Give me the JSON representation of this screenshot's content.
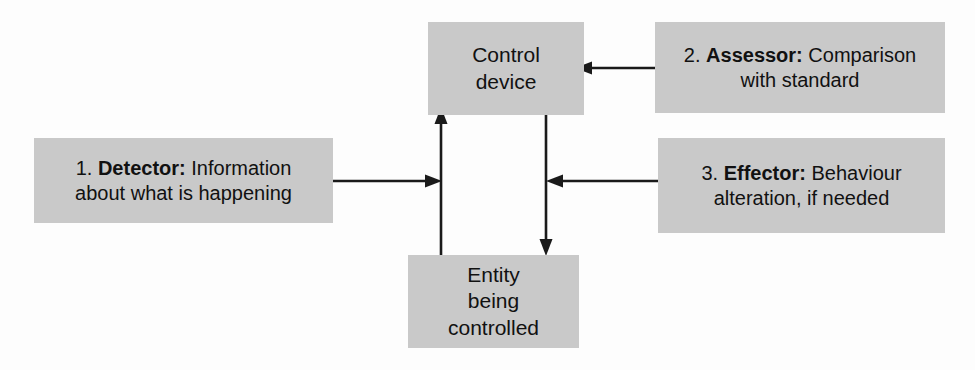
{
  "diagram": {
    "background_color": "#ffffff",
    "box_fill_color": "#c9c9c9",
    "text_color": "#111111",
    "arrow_color": "#1a1a1a",
    "nodes": {
      "control_device": {
        "label": "Control device",
        "line1": "Control",
        "line2": "device"
      },
      "entity_controlled": {
        "label": "Entity being controlled",
        "line1": "Entity",
        "line2": "being",
        "line3": "controlled"
      },
      "detector": {
        "number": "1.",
        "term": "Detector:",
        "description_line1": "Information",
        "description_line2": "about what is happening",
        "full_label": "1. Detector: Information about what is happening"
      },
      "assessor": {
        "number": "2.",
        "term": "Assessor:",
        "description_line1": "Comparison",
        "description_line2": "with standard",
        "full_label": "2. Assessor: Comparison with standard"
      },
      "effector": {
        "number": "3.",
        "term": "Effector:",
        "description_line1": "Behaviour",
        "description_line2": "alteration, if needed",
        "full_label": "3. Effector: Behaviour alteration, if needed"
      }
    },
    "arrows": [
      {
        "name": "entity-to-control-arrow",
        "from": "Entity being controlled",
        "to": "Control device",
        "direction": "up"
      },
      {
        "name": "control-to-entity-arrow",
        "from": "Control device",
        "to": "Entity being controlled",
        "direction": "down"
      },
      {
        "name": "detector-to-feedback-arrow",
        "from": "1. Detector",
        "to": "feedback line",
        "direction": "right"
      },
      {
        "name": "assessor-to-control-arrow",
        "from": "2. Assessor",
        "to": "Control device",
        "direction": "left"
      },
      {
        "name": "effector-to-output-arrow",
        "from": "3. Effector",
        "to": "output line",
        "direction": "left"
      }
    ]
  }
}
